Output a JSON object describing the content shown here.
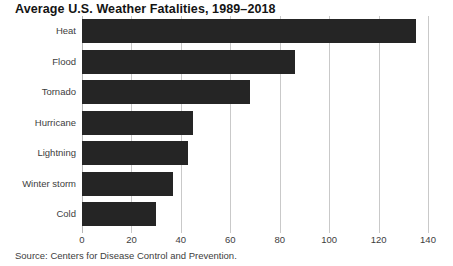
{
  "chart_data": {
    "type": "bar",
    "orientation": "horizontal",
    "title": "Average U.S. Weather Fatalities, 1989–2018",
    "categories": [
      "Heat",
      "Flood",
      "Tornado",
      "Hurricane",
      "Lightning",
      "Winter storm",
      "Cold"
    ],
    "values": [
      135,
      86,
      68,
      45,
      43,
      37,
      30
    ],
    "xlabel": "",
    "ylabel": "",
    "xlim": [
      0,
      140
    ],
    "xticks": [
      0,
      20,
      40,
      60,
      80,
      100,
      120,
      140
    ],
    "xtick_labels": [
      "0",
      "20",
      "40",
      "60",
      "80",
      "100",
      "120",
      "140"
    ],
    "grid": "vertical",
    "legend": "none",
    "bar_color": "#252525",
    "gridline_color": "#c9c9c9",
    "source": "Source: Centers for Disease Control and Prevention."
  }
}
